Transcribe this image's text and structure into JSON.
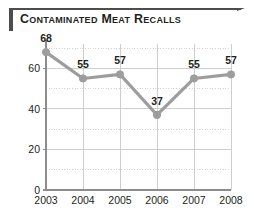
{
  "title": {
    "text": "Contaminated Meat Recalls"
  },
  "colors": {
    "line": "#9d9d9d",
    "marker": "#9d9d9d",
    "axis": "#8c8c8c",
    "gridline": "#c9c9c9",
    "text": "#231f20",
    "title_bar": "#4d4d4d"
  },
  "chart_data": {
    "type": "line",
    "title": "Contaminated Meat Recalls",
    "xlabel": "",
    "ylabel": "",
    "categories": [
      "2003",
      "2004",
      "2005",
      "2006",
      "2007",
      "2008"
    ],
    "values": [
      68,
      55,
      57,
      37,
      55,
      57
    ],
    "point_labels": [
      "68",
      "55",
      "57",
      "37",
      "55",
      "57"
    ],
    "ylim": [
      0,
      72
    ],
    "yticks": [
      0,
      20,
      40,
      60
    ],
    "ytick_labels": [
      "0",
      "20",
      "40",
      "60"
    ],
    "minor_gridline_step": 10,
    "grid": true,
    "legend": false
  }
}
